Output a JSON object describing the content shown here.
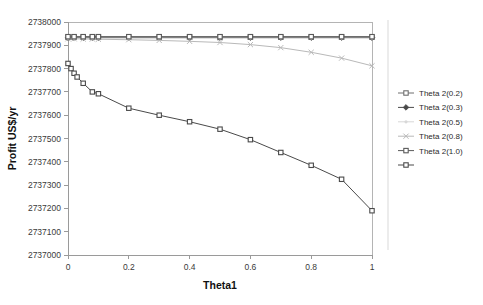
{
  "chart_data": {
    "type": "line",
    "title": "",
    "xlabel": "Theta1",
    "ylabel": "Profit  US$/yr",
    "xlim": [
      0,
      1
    ],
    "ylim": [
      2737000,
      2738000
    ],
    "xticks": [
      "0",
      "0.2",
      "0.4",
      "0.6",
      "0.8",
      "1"
    ],
    "xtick_values": [
      0,
      0.2,
      0.4,
      0.6,
      0.8,
      1
    ],
    "yticks": [
      "2737000",
      "2737100",
      "2737200",
      "2737300",
      "2737400",
      "2737500",
      "2737600",
      "2737700",
      "2737800",
      "2737900",
      "2738000"
    ],
    "ytick_values": [
      2737000,
      2737100,
      2737200,
      2737300,
      2737400,
      2737500,
      2737600,
      2737700,
      2737800,
      2737900,
      2738000
    ],
    "grid": false,
    "legend_position": "right",
    "x": [
      0,
      0.02,
      0.05,
      0.08,
      0.1,
      0.2,
      0.3,
      0.4,
      0.5,
      0.6,
      0.7,
      0.8,
      0.9,
      1
    ],
    "series": [
      {
        "name": "Theta 2(0.2)",
        "marker": "square",
        "color": "#6e6e6e",
        "values": [
          2737935,
          2737935,
          2737935,
          2737935,
          2737935,
          2737935,
          2737935,
          2737935,
          2737935,
          2737935,
          2737935,
          2737935,
          2737935,
          2737935
        ]
      },
      {
        "name": "Theta 2(0.3)",
        "marker": "diamond",
        "color": "#4a4a4a",
        "values": [
          2737933,
          2737933,
          2737933,
          2737933,
          2737933,
          2737933,
          2737933,
          2737933,
          2737933,
          2737933,
          2737933,
          2737933,
          2737933,
          2737933
        ]
      },
      {
        "name": "Theta 2(0.5)",
        "marker": "dot",
        "color": "#d8d8d8",
        "values": [
          2737931,
          2737931,
          2737931,
          2737931,
          2737931,
          2737931,
          2737931,
          2737931,
          2737931,
          2737931,
          2737931,
          2737931,
          2737931,
          2737931
        ]
      },
      {
        "name": "Theta 2(0.8)",
        "marker": "cross",
        "color": "#b9b9b9",
        "values": [
          2737928,
          2737928,
          2737927,
          2737927,
          2737926,
          2737924,
          2737921,
          2737917,
          2737912,
          2737903,
          2737890,
          2737870,
          2737845,
          2737812
        ]
      },
      {
        "name": "Theta 2(1.0)",
        "marker": "square",
        "color": "#5a5a5a",
        "values": [
          2737937,
          2737937,
          2737937,
          2737937,
          2737937,
          2737937,
          2737937,
          2737937,
          2737937,
          2737937,
          2737937,
          2737937,
          2737937,
          2737937
        ]
      },
      {
        "name": "",
        "marker": "square",
        "color": "#4a4a4a",
        "values": [
          2737822,
          2737790,
          2737758,
          2737734,
          2737700,
          2737632,
          2737604,
          2737570,
          2737540,
          2737496,
          2737443,
          2737384,
          2737325,
          2737232
        ]
      }
    ],
    "lower_curve_note": "descending dark series from 2737822 at Theta1=0 to 2737190 at Theta1=1",
    "lower_curve_x": [
      0,
      0.01,
      0.02,
      0.03,
      0.05,
      0.08,
      0.1,
      0.2,
      0.3,
      0.4,
      0.5,
      0.6,
      0.7,
      0.8,
      0.9,
      1
    ],
    "lower_curve_y": [
      2737822,
      2737800,
      2737780,
      2737764,
      2737737,
      2737700,
      2737692,
      2737630,
      2737600,
      2737572,
      2737540,
      2737495,
      2737440,
      2737385,
      2737325,
      2737190
    ]
  }
}
